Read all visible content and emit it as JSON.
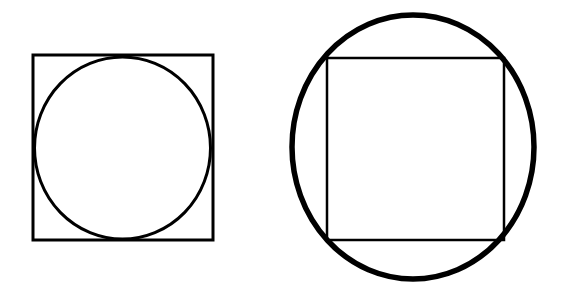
{
  "page": {
    "background_color": "#ffffff",
    "stroke_color": "#000000",
    "width": 565,
    "height": 293
  },
  "figures": [
    {
      "id": "left-figure",
      "name": "circle-inscribed-in-square",
      "caption": "",
      "shapes": [
        {
          "type": "rect",
          "name": "outer-square",
          "x": 33,
          "y": 55,
          "width": 180,
          "height": 185,
          "stroke_width": 3,
          "stroke_color": "#000000",
          "fill": "none"
        },
        {
          "type": "ellipse",
          "name": "inscribed-circle",
          "cx": 122.5,
          "cy": 148,
          "rx": 88,
          "ry": 91,
          "stroke_width": 3,
          "stroke_color": "#000000",
          "fill": "none"
        }
      ]
    },
    {
      "id": "right-figure",
      "name": "square-inscribed-in-circle",
      "caption": "",
      "shapes": [
        {
          "type": "ellipse",
          "name": "outer-circle",
          "cx": 413,
          "cy": 147,
          "rx": 121,
          "ry": 132,
          "stroke_width": 5.5,
          "stroke_color": "#000000",
          "fill": "none"
        },
        {
          "type": "rect",
          "name": "inscribed-square",
          "x": 327,
          "y": 58,
          "width": 177,
          "height": 182,
          "stroke_width": 2.5,
          "stroke_color": "#000000",
          "fill": "none"
        }
      ]
    }
  ]
}
